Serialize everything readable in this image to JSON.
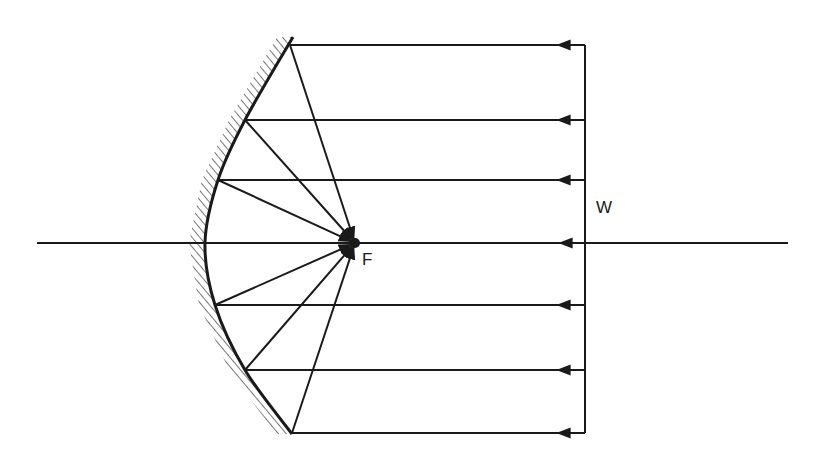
{
  "diagram": {
    "labels": {
      "focus": "F",
      "wavefront": "W"
    },
    "colors": {
      "line": "#1a1a1a",
      "background": "#ffffff"
    },
    "axis": {
      "x1": 37,
      "x2": 788,
      "y": 243
    },
    "focus_point": {
      "x": 355,
      "y": 243
    },
    "wavefront_x": 585,
    "mirror_points": [
      [
        293,
        37
      ],
      [
        245,
        120
      ],
      [
        218,
        180
      ],
      [
        205,
        243
      ],
      [
        215,
        305
      ],
      [
        245,
        370
      ],
      [
        292,
        434
      ]
    ],
    "rays": [
      {
        "y": 45,
        "mirror_x": 290
      },
      {
        "y": 120,
        "mirror_x": 245
      },
      {
        "y": 180,
        "mirror_x": 218
      },
      {
        "y": 305,
        "mirror_x": 215
      },
      {
        "y": 370,
        "mirror_x": 245
      },
      {
        "y": 433,
        "mirror_x": 292
      }
    ]
  }
}
